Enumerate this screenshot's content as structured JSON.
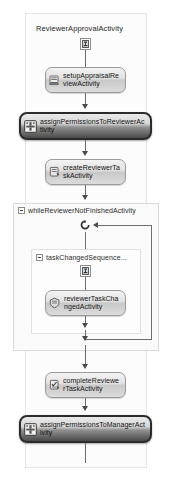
{
  "diagram": {
    "type": "workflow-designer",
    "root_title": "ReviewerApprovalActivity",
    "background": "#ffffff",
    "selected_fill": "#4a4a4a",
    "normal_fill": "#dcdcdc"
  },
  "nodes": {
    "start_marker": {
      "icon": "workflow-start-icon"
    },
    "setup_appraisal": {
      "label": "setupAppraisalReviewActivity",
      "icon": "code-activity-icon",
      "state": "normal"
    },
    "assign_permissions_reviewer": {
      "label": "assignPermissionsToReviewerActivity",
      "icon": "custom-activity-icon",
      "state": "selected"
    },
    "create_reviewer_task": {
      "label": "createReviewerTaskActivity",
      "icon": "task-activity-icon",
      "state": "normal"
    },
    "while_container": {
      "label": "whileReviewerNotFinishedActivity",
      "icon": "while-expander-icon",
      "loop_icon": "loop-arrow-icon"
    },
    "task_changed_sequence": {
      "label": "taskChangedSequence...",
      "icon": "sequence-expander-icon"
    },
    "sequence_marker": {
      "icon": "sequence-start-icon"
    },
    "reviewer_task_changed": {
      "label": "reviewerTaskChangedActivity",
      "icon": "event-handler-icon",
      "state": "normal"
    },
    "complete_reviewer_task": {
      "label": "completeReviewerTaskActivity",
      "icon": "complete-task-icon",
      "state": "normal"
    },
    "assign_permissions_manager": {
      "label": "assignPermissionsToManagerActivity",
      "icon": "custom-activity-icon",
      "state": "selected"
    }
  }
}
